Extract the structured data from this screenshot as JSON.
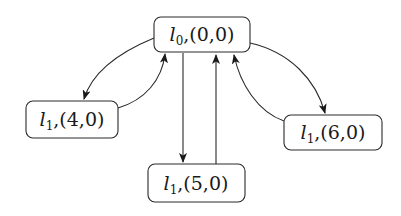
{
  "diagram": {
    "type": "state-graph",
    "nodes": [
      {
        "id": "n0",
        "location": "l",
        "location_sub": "0",
        "valuation": ",(0,0)",
        "x": 154,
        "y": 17,
        "w": 96,
        "h": 35
      },
      {
        "id": "n1",
        "location": "l",
        "location_sub": "1",
        "valuation": ",(4,0)",
        "x": 26,
        "y": 101,
        "w": 92,
        "h": 37
      },
      {
        "id": "n2",
        "location": "l",
        "location_sub": "1",
        "valuation": ",(5,0)",
        "x": 148,
        "y": 164,
        "w": 97,
        "h": 38
      },
      {
        "id": "n3",
        "location": "l",
        "location_sub": "1",
        "valuation": ",(6,0)",
        "x": 284,
        "y": 115,
        "w": 98,
        "h": 35
      }
    ],
    "edges": [
      {
        "from": "n0",
        "to": "n1"
      },
      {
        "from": "n1",
        "to": "n0"
      },
      {
        "from": "n0",
        "to": "n2"
      },
      {
        "from": "n2",
        "to": "n0"
      },
      {
        "from": "n0",
        "to": "n3"
      },
      {
        "from": "n3",
        "to": "n0"
      }
    ],
    "colors": {
      "stroke": "#2a2a2a",
      "text": "#1a1a1a",
      "background": "#ffffff"
    }
  }
}
